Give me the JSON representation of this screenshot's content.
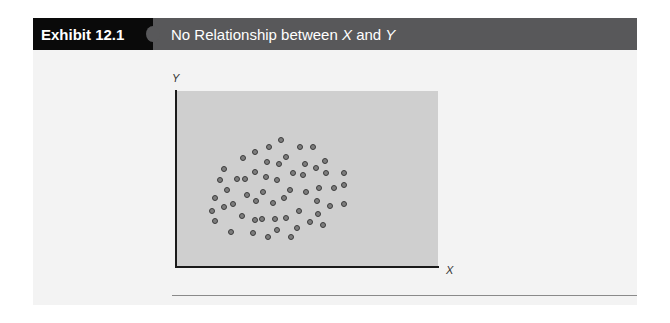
{
  "exhibit": {
    "label": "Exhibit 12.1",
    "title_prefix": "No Relationship between ",
    "title_var1": "X",
    "title_mid": " and ",
    "title_var2": "Y"
  },
  "colors": {
    "header_label_bg": "#0a0a0a",
    "header_bg": "#58585a",
    "plot_bg": "#cfcfcf",
    "body_bg": "#f3f3f3",
    "dot_fill": "#7d7d7d",
    "dot_stroke": "#3c3c3c"
  },
  "chart_data": {
    "type": "scatter",
    "title": "No Relationship between X and Y",
    "xlabel": "X",
    "ylabel": "Y",
    "xlim": [
      0,
      100
    ],
    "ylim": [
      0,
      100
    ],
    "grid": false,
    "legend": null,
    "ticks": "none",
    "note": "Points are a random cloud with no correlation; coordinates are relative positions (0-100) within the plot area.",
    "points": [
      {
        "x": 40.1,
        "y": 72.2
      },
      {
        "x": 30.2,
        "y": 65.3
      },
      {
        "x": 35.5,
        "y": 68.2
      },
      {
        "x": 47.3,
        "y": 68.2
      },
      {
        "x": 52.3,
        "y": 68.2
      },
      {
        "x": 25.6,
        "y": 61.9
      },
      {
        "x": 42.0,
        "y": 62.5
      },
      {
        "x": 34.7,
        "y": 59.7
      },
      {
        "x": 39.3,
        "y": 58.5
      },
      {
        "x": 49.2,
        "y": 58.5
      },
      {
        "x": 56.9,
        "y": 60.2
      },
      {
        "x": 18.3,
        "y": 55.7
      },
      {
        "x": 30.2,
        "y": 54.0
      },
      {
        "x": 53.4,
        "y": 56.3
      },
      {
        "x": 57.3,
        "y": 53.4
      },
      {
        "x": 64.1,
        "y": 53.4
      },
      {
        "x": 16.8,
        "y": 49.4
      },
      {
        "x": 23.3,
        "y": 50.0
      },
      {
        "x": 26.3,
        "y": 50.0
      },
      {
        "x": 34.4,
        "y": 51.1
      },
      {
        "x": 38.5,
        "y": 49.4
      },
      {
        "x": 44.7,
        "y": 53.4
      },
      {
        "x": 48.5,
        "y": 52.3
      },
      {
        "x": 19.5,
        "y": 43.8
      },
      {
        "x": 27.1,
        "y": 40.9
      },
      {
        "x": 33.2,
        "y": 42.6
      },
      {
        "x": 43.5,
        "y": 43.8
      },
      {
        "x": 49.6,
        "y": 42.6
      },
      {
        "x": 54.6,
        "y": 44.9
      },
      {
        "x": 60.3,
        "y": 44.9
      },
      {
        "x": 64.1,
        "y": 46.6
      },
      {
        "x": 14.9,
        "y": 39.2
      },
      {
        "x": 30.5,
        "y": 37.5
      },
      {
        "x": 41.2,
        "y": 39.2
      },
      {
        "x": 53.8,
        "y": 37.5
      },
      {
        "x": 21.8,
        "y": 35.8
      },
      {
        "x": 18.3,
        "y": 34.1
      },
      {
        "x": 37.0,
        "y": 36.4
      },
      {
        "x": 58.8,
        "y": 34.7
      },
      {
        "x": 64.1,
        "y": 35.8
      },
      {
        "x": 13.7,
        "y": 31.8
      },
      {
        "x": 25.2,
        "y": 29.0
      },
      {
        "x": 46.9,
        "y": 31.8
      },
      {
        "x": 54.2,
        "y": 30.1
      },
      {
        "x": 14.9,
        "y": 26.1
      },
      {
        "x": 30.2,
        "y": 26.7
      },
      {
        "x": 32.8,
        "y": 27.3
      },
      {
        "x": 37.8,
        "y": 27.3
      },
      {
        "x": 42.0,
        "y": 27.8
      },
      {
        "x": 51.1,
        "y": 25.6
      },
      {
        "x": 56.1,
        "y": 23.9
      },
      {
        "x": 21.0,
        "y": 19.9
      },
      {
        "x": 29.4,
        "y": 19.3
      },
      {
        "x": 38.5,
        "y": 21.0
      },
      {
        "x": 46.2,
        "y": 22.2
      },
      {
        "x": 35.1,
        "y": 17.0
      },
      {
        "x": 43.9,
        "y": 17.0
      }
    ]
  }
}
